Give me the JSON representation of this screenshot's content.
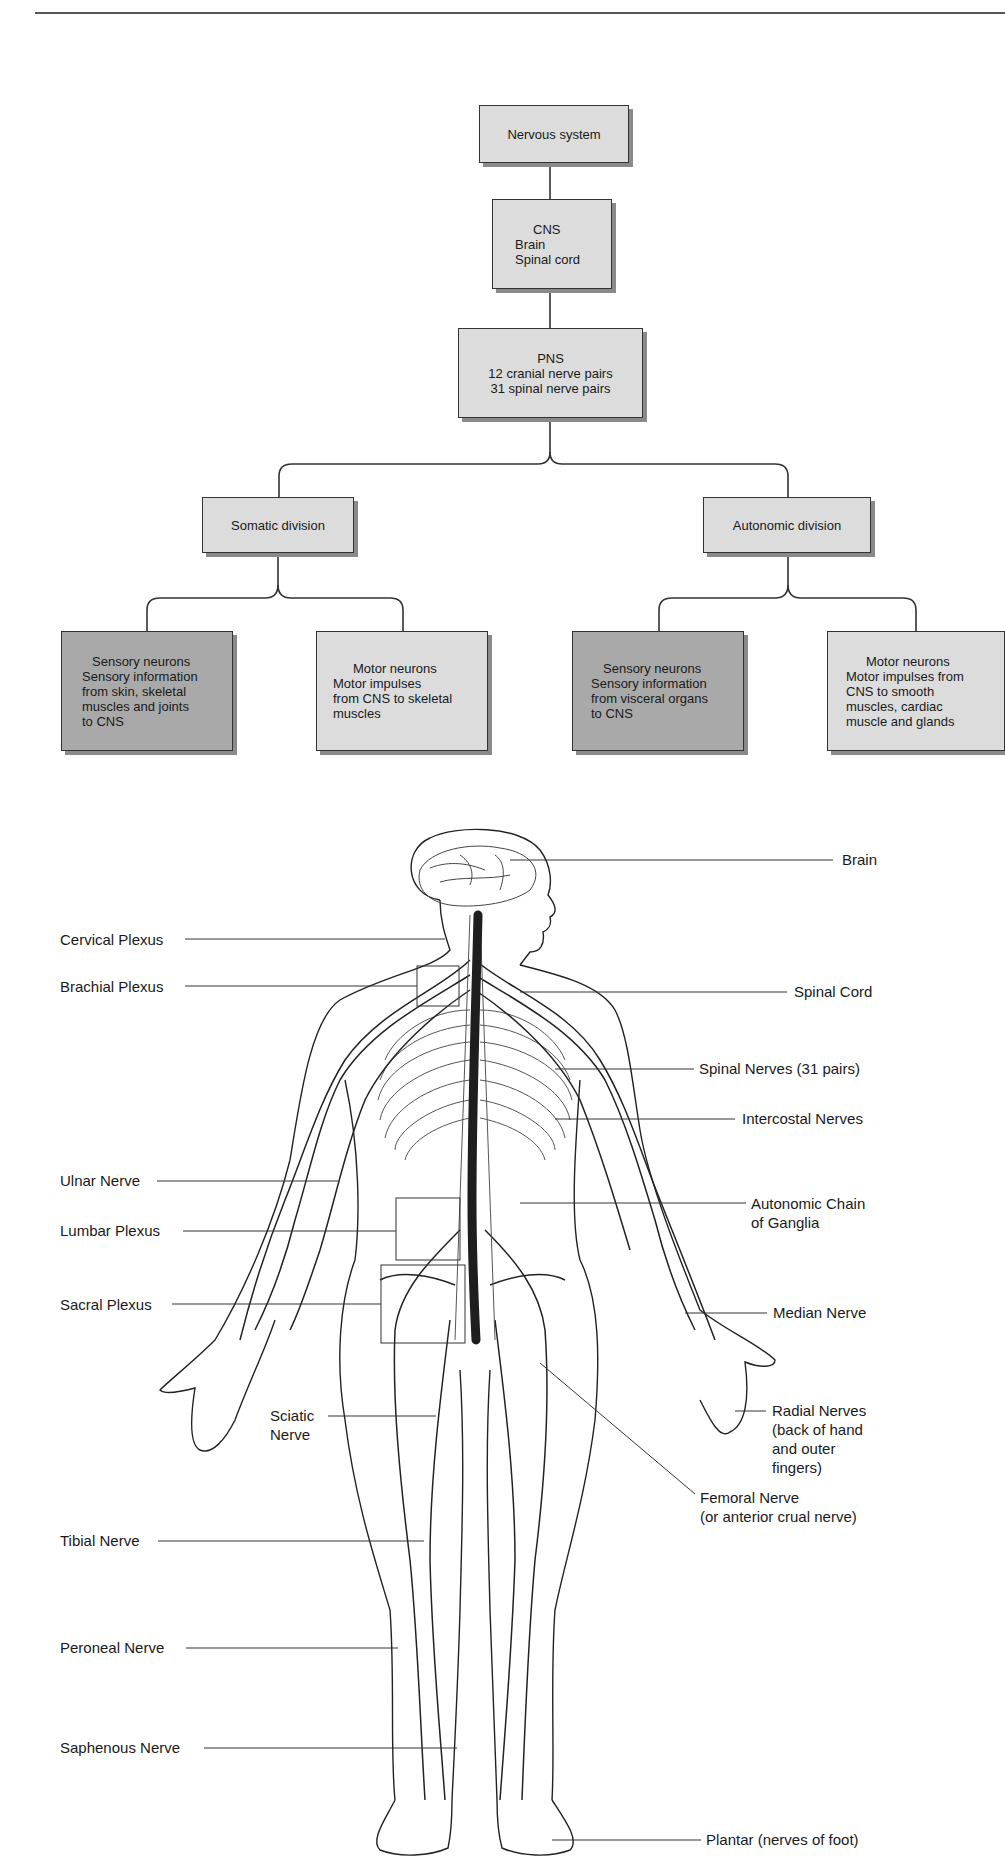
{
  "flowchart": {
    "root": {
      "lines": [
        "Nervous system"
      ]
    },
    "cns": {
      "lines": [
        "CNS",
        "Brain",
        "Spinal cord"
      ]
    },
    "pns": {
      "lines": [
        "PNS",
        "12 cranial nerve pairs",
        "31 spinal nerve pairs"
      ]
    },
    "somatic": {
      "lines": [
        "Somatic division"
      ]
    },
    "autonomic": {
      "lines": [
        "Autonomic division"
      ]
    },
    "somatic_sensory": {
      "lines": [
        "Sensory neurons",
        "Sensory information",
        "from skin, skeletal",
        "muscles and joints",
        "to CNS"
      ]
    },
    "somatic_motor": {
      "lines": [
        "Motor neurons",
        "Motor impulses",
        "from CNS to skeletal",
        "muscles"
      ]
    },
    "autonomic_sensory": {
      "lines": [
        "Sensory neurons",
        "Sensory information",
        "from visceral organs",
        "to CNS"
      ]
    },
    "autonomic_motor": {
      "lines": [
        "Motor neurons",
        "Motor impulses from",
        "CNS to smooth",
        "muscles, cardiac",
        "muscle and glands"
      ]
    }
  },
  "anatomy": {
    "left_labels": [
      {
        "id": "cervical-plexus",
        "lines": [
          "Cervical Plexus"
        ]
      },
      {
        "id": "brachial-plexus",
        "lines": [
          "Brachial Plexus"
        ]
      },
      {
        "id": "ulnar-nerve",
        "lines": [
          "Ulnar Nerve"
        ]
      },
      {
        "id": "lumbar-plexus",
        "lines": [
          "Lumbar Plexus"
        ]
      },
      {
        "id": "sacral-plexus",
        "lines": [
          "Sacral Plexus"
        ]
      },
      {
        "id": "sciatic-nerve",
        "lines": [
          "Sciatic",
          "Nerve"
        ]
      },
      {
        "id": "tibial-nerve",
        "lines": [
          "Tibial Nerve"
        ]
      },
      {
        "id": "peroneal-nerve",
        "lines": [
          "Peroneal Nerve"
        ]
      },
      {
        "id": "saphenous-nerve",
        "lines": [
          "Saphenous Nerve"
        ]
      }
    ],
    "right_labels": [
      {
        "id": "brain",
        "lines": [
          "Brain"
        ]
      },
      {
        "id": "spinal-cord",
        "lines": [
          "Spinal Cord"
        ]
      },
      {
        "id": "spinal-nerves",
        "lines": [
          "Spinal Nerves (31 pairs)"
        ]
      },
      {
        "id": "intercostal-nerves",
        "lines": [
          "Intercostal Nerves"
        ]
      },
      {
        "id": "autonomic-chain",
        "lines": [
          "Autonomic Chain",
          "of Ganglia"
        ]
      },
      {
        "id": "median-nerve",
        "lines": [
          "Median Nerve"
        ]
      },
      {
        "id": "radial-nerves",
        "lines": [
          "Radial Nerves",
          "(back of hand",
          "and outer",
          "fingers)"
        ]
      },
      {
        "id": "femoral-nerve",
        "lines": [
          "Femoral Nerve",
          "(or anterior crual nerve)"
        ]
      },
      {
        "id": "plantar",
        "lines": [
          "Plantar (nerves of foot)"
        ]
      }
    ]
  },
  "colors": {
    "box_light": "#dcdcdc",
    "box_dark": "#a9a9a9",
    "line": "#333333",
    "spinal_cord": "#1e1e1e"
  }
}
